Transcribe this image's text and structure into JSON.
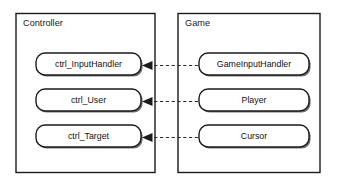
{
  "diagram": {
    "type": "block-diagram",
    "title": "",
    "background_color": "#ffffff",
    "line_color": "#1a1a1a",
    "groups": [
      {
        "id": "controller",
        "label": "Controller",
        "nodes": [
          {
            "id": "ctrl_inputhandler",
            "label": "ctrl_InputHandler"
          },
          {
            "id": "ctrl_user",
            "label": "ctrl_User"
          },
          {
            "id": "ctrl_target",
            "label": "ctrl_Target"
          }
        ]
      },
      {
        "id": "game",
        "label": "Game",
        "nodes": [
          {
            "id": "gameinputhandler",
            "label": "GameInputHandler"
          },
          {
            "id": "player",
            "label": "Player"
          },
          {
            "id": "cursor",
            "label": "Cursor"
          }
        ]
      }
    ],
    "connections": [
      {
        "from": "gameinputhandler",
        "to": "ctrl_inputhandler",
        "style": "dashed",
        "arrow": "left",
        "label": ""
      },
      {
        "from": "player",
        "to": "ctrl_user",
        "style": "dashed",
        "arrow": "left",
        "label": ""
      },
      {
        "from": "cursor",
        "to": "ctrl_target",
        "style": "dashed",
        "arrow": "left",
        "label": ""
      }
    ]
  }
}
